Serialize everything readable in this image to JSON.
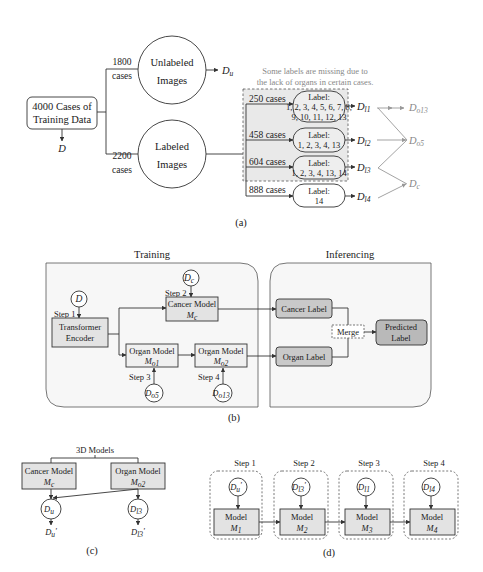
{
  "panel_a": {
    "caption": "(a)",
    "source_box": {
      "line1": "4000 Cases of",
      "line2": "Training Data"
    },
    "source_output": "D",
    "unlabeled": {
      "count": "1800",
      "unit": "cases",
      "line1": "Unlabeled",
      "line2": "Images",
      "output": "D",
      "output_sub": "u"
    },
    "labeled": {
      "count": "2200",
      "unit": "cases",
      "line1": "Labeled",
      "line2": "Images"
    },
    "note": {
      "line1": "Some labels are missing due to",
      "line2": "the lack of organs in certain cases."
    },
    "groups": [
      {
        "cases": "250 cases",
        "title": "Label:",
        "line1": "1, 2, 3, 4, 5, 6, 7, 8,",
        "line2": "9, 10, 11, 12, 13",
        "output": "D",
        "output_sub": "l1"
      },
      {
        "cases": "458 cases",
        "title": "Label:",
        "line1": "1, 2, 3, 4, 13",
        "line2": "",
        "output": "D",
        "output_sub": "l2"
      },
      {
        "cases": "604 cases",
        "title": "Label:",
        "line1": "1, 2, 3, 4, 13, 14",
        "line2": "",
        "output": "D",
        "output_sub": "l3"
      },
      {
        "cases": "888 cases",
        "title": "Label:",
        "line1": "14",
        "line2": "",
        "output": "D",
        "output_sub": "l4"
      }
    ],
    "merged": [
      {
        "name": "D",
        "sub": "o13"
      },
      {
        "name": "D",
        "sub": "o5"
      },
      {
        "name": "D",
        "sub": "c"
      }
    ]
  },
  "panel_b": {
    "caption": "(b)",
    "training_title": "Training",
    "inferencing_title": "Inferencing",
    "input_d": "D",
    "step1": "Step 1",
    "step2": "Step 2",
    "step3": "Step 3",
    "step4": "Step 4",
    "encoder": {
      "line1": "Transformer",
      "line2": "Encoder"
    },
    "cancer_model": {
      "line1": "Cancer Model",
      "sym": "M",
      "sub": "c"
    },
    "organ_model_1": {
      "line1": "Organ Model",
      "sym": "M",
      "sub": "o1"
    },
    "organ_model_2": {
      "line1": "Organ Model",
      "sym": "M",
      "sub": "o2"
    },
    "dc": {
      "sym": "D",
      "sub": "c"
    },
    "do5": {
      "sym": "D",
      "sub": "o5"
    },
    "do13": {
      "sym": "D",
      "sub": "o13"
    },
    "cancer_label": "Cancer Label",
    "organ_label": "Organ Label",
    "merge": "Merge",
    "predicted": {
      "line1": "Predicted",
      "line2": "Label"
    }
  },
  "panel_c": {
    "caption": "(c)",
    "title": "3D Models",
    "cancer_model": {
      "line1": "Cancer Model",
      "sym": "M",
      "sub": "c"
    },
    "organ_model": {
      "line1": "Organ Model",
      "sym": "M",
      "sub": "o2"
    },
    "du": {
      "sym": "D",
      "sub": "u"
    },
    "dl3": {
      "sym": "D",
      "sub": "l3"
    },
    "du_out": {
      "sym": "D",
      "sub": "u",
      "prime": "'"
    },
    "dl3_out": {
      "sym": "D",
      "sub": "l3",
      "prime": "'"
    }
  },
  "panel_d": {
    "caption": "(d)",
    "steps": [
      {
        "label": "Step 1",
        "data_sym": "D",
        "data_sub": "u",
        "prime": "'",
        "model": "Model",
        "model_sym": "M",
        "model_sub": "1"
      },
      {
        "label": "Step 2",
        "data_sym": "D",
        "data_sub": "l3",
        "prime": "'",
        "model": "Model",
        "model_sym": "M",
        "model_sub": "2"
      },
      {
        "label": "Step 3",
        "data_sym": "D",
        "data_sub": "l1",
        "prime": "",
        "model": "Model",
        "model_sym": "M",
        "model_sub": "3"
      },
      {
        "label": "Step 4",
        "data_sym": "D",
        "data_sub": "l4",
        "prime": "",
        "model": "Model",
        "model_sym": "M",
        "model_sub": "4"
      }
    ]
  },
  "colors": {
    "box_fill": "#e6e6e6",
    "dark_box_fill": "#c8c8c8",
    "panel_fill": "#f7f7f7",
    "group_fill": "#ebebeb",
    "line": "#333333",
    "muted": "#999999"
  }
}
